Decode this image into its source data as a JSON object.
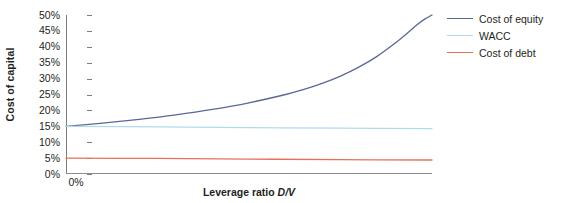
{
  "chart_data": {
    "type": "line",
    "title": "",
    "xlabel": "Leverage ratio D/V",
    "xlabel_text": "Leverage ratio ",
    "xlabel_symbol": "D/V",
    "ylabel": "Cost of capital",
    "ylim": [
      0,
      50
    ],
    "xlim": [
      0,
      100
    ],
    "grid": false,
    "y_ticks": [
      "50%",
      "45%",
      "40%",
      "35%",
      "30%",
      "25%",
      "20%",
      "15%",
      "10%",
      "5%",
      "0%"
    ],
    "y_tick_values": [
      50,
      45,
      40,
      35,
      30,
      25,
      20,
      15,
      10,
      5,
      0
    ],
    "x_ticks": [
      "0%"
    ],
    "x_tick_values": [
      0
    ],
    "legend_position": "right",
    "series": [
      {
        "name": "Cost of equity",
        "color": "#5a6898",
        "x": [
          0,
          10,
          20,
          30,
          40,
          50,
          60,
          65,
          70,
          75,
          80,
          85,
          90,
          93,
          96,
          98,
          100
        ],
        "values": [
          15.0,
          16.0,
          17.2,
          18.6,
          20.3,
          22.4,
          25.0,
          26.6,
          28.5,
          30.8,
          33.6,
          37.0,
          41.2,
          44.0,
          47.0,
          48.7,
          50.0
        ]
      },
      {
        "name": "WACC",
        "color": "#aedced",
        "x": [
          0,
          25,
          50,
          75,
          100
        ],
        "values": [
          15.0,
          14.8,
          14.6,
          14.4,
          14.3
        ]
      },
      {
        "name": "Cost of debt",
        "color": "#e8705a",
        "x": [
          0,
          25,
          50,
          75,
          100
        ],
        "values": [
          5.0,
          4.9,
          4.7,
          4.5,
          4.4
        ]
      }
    ]
  },
  "legend": {
    "items": [
      {
        "label": "Cost of equity",
        "color": "#5a6898"
      },
      {
        "label": "WACC",
        "color": "#aedced"
      },
      {
        "label": "Cost of debt",
        "color": "#e8705a"
      }
    ]
  },
  "axes": {
    "y_title": "Cost of capital",
    "x_title_prefix": "Leverage ratio ",
    "x_title_symbol": "D/V",
    "x_first_tick": "0%"
  },
  "colors": {
    "axis": "#7d7d7d",
    "text": "#231f20",
    "background": "#ffffff"
  }
}
